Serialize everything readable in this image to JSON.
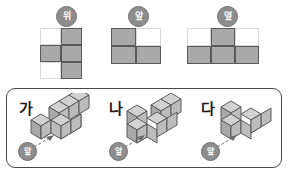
{
  "views_section": {
    "groups": [
      {
        "id": "top",
        "badge_label": "위",
        "badge_meaning": "top-view",
        "cols": 2,
        "rows": 3,
        "filled": [
          [
            0,
            1
          ],
          [
            1,
            1
          ],
          [
            0,
            1
          ]
        ]
      },
      {
        "id": "front",
        "badge_label": "앞",
        "badge_meaning": "front-view",
        "cols": 2,
        "rows": 2,
        "filled": [
          [
            1,
            0
          ],
          [
            1,
            1
          ]
        ]
      },
      {
        "id": "side",
        "badge_label": "옆",
        "badge_meaning": "side-view",
        "cols": 3,
        "rows": 2,
        "filled": [
          [
            0,
            1,
            0
          ],
          [
            1,
            1,
            1
          ]
        ]
      }
    ]
  },
  "options_panel": {
    "options": [
      {
        "id": "ga",
        "letter": "가",
        "front_badge_label": "앞",
        "cube_count": 7
      },
      {
        "id": "na",
        "letter": "나",
        "front_badge_label": "앞",
        "cube_count": 7
      },
      {
        "id": "da",
        "letter": "다",
        "front_badge_label": "앞",
        "cube_count": 5
      }
    ]
  },
  "colors": {
    "cell_fill": "#a9a9a9",
    "cell_empty_border": "#d9d9d9",
    "cell_filled_border": "#595959",
    "badge_fill": "#8d8d8d",
    "badge_text": "#ffffff",
    "panel_border": "#4a4a4a",
    "cube_top_face": "#d2d2d2",
    "cube_left_face": "#a9a9a9",
    "cube_right_face": "#bcbcbc",
    "cube_edge": "#5a5a5a",
    "background": "#ffffff"
  }
}
